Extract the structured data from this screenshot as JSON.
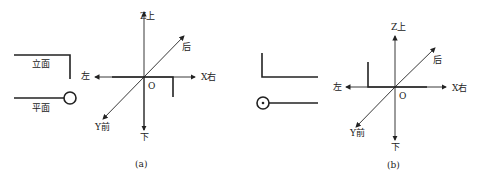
{
  "figure_a": {
    "caption": "(a)",
    "elevation_label": "立面",
    "plan_label": "平面",
    "axis_labels": {
      "z_up": "Z上",
      "down": "下",
      "left": "左",
      "x_right": "X右",
      "back": "后",
      "y_front": "Y前",
      "origin": "O"
    }
  },
  "figure_b": {
    "caption": "(b)",
    "axis_labels": {
      "z_up": "Z上",
      "down": "下",
      "left": "左",
      "x_right": "X右",
      "back": "后",
      "y_front": "Y前",
      "origin": "O"
    }
  },
  "colors": {
    "line": "#222222",
    "background": "#ffffff"
  }
}
